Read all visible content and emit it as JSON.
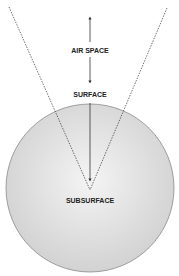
{
  "diagram": {
    "labels": {
      "air_space": "AIR SPACE",
      "surface": "SURFACE",
      "subsurface": "SUBSURFACE"
    },
    "colors": {
      "sphere_fill_center": "#f4f4f4",
      "sphere_fill_edge": "#d2d2d2",
      "sphere_stroke": "#8a8a8a",
      "lines": "#333333",
      "text": "#222222"
    }
  }
}
